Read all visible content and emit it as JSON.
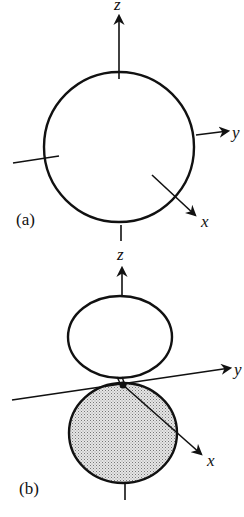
{
  "figure": {
    "panel_a": {
      "label": "(a)",
      "shape": "sphere (s orbital)",
      "axes": {
        "z": "z",
        "y": "y",
        "x": "x"
      }
    },
    "panel_b": {
      "label": "(b)",
      "shape": "dumbbell (p_z orbital), lower lobe shaded",
      "axes": {
        "z": "z",
        "y": "y",
        "x": "x"
      }
    },
    "colors": {
      "stroke": "#111111",
      "shade": "#c8c8c8",
      "background": "#ffffff"
    }
  }
}
